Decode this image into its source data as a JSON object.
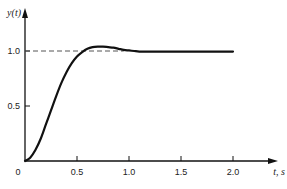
{
  "chart_data": {
    "type": "line",
    "title": "",
    "xlabel": "t, s",
    "ylabel": "y(t)",
    "xlim": [
      0,
      2.1
    ],
    "ylim": [
      0,
      1.2
    ],
    "x_ticks": [
      "0",
      "0.5",
      "1.0",
      "1.5",
      "2.0"
    ],
    "y_ticks": [
      "0.5",
      "1.0"
    ],
    "grid": false,
    "legend": null,
    "annotations": [
      {
        "type": "dashed-reference-line",
        "y": 1.0,
        "label": "1.0"
      }
    ],
    "series": [
      {
        "name": "step response y(t)",
        "x": [
          0,
          0.05,
          0.1,
          0.15,
          0.2,
          0.25,
          0.3,
          0.35,
          0.4,
          0.45,
          0.5,
          0.55,
          0.6,
          0.65,
          0.7,
          0.75,
          0.8,
          0.85,
          0.9,
          0.95,
          1.0,
          1.05,
          1.1,
          1.2,
          1.3,
          1.4,
          1.5,
          1.6,
          1.7,
          1.8,
          1.9,
          2.0
        ],
        "values": [
          0,
          0.03,
          0.1,
          0.2,
          0.33,
          0.46,
          0.59,
          0.71,
          0.81,
          0.89,
          0.95,
          0.99,
          1.02,
          1.035,
          1.04,
          1.04,
          1.035,
          1.03,
          1.02,
          1.01,
          1.005,
          1.0,
          0.995,
          0.995,
          0.995,
          0.995,
          0.995,
          0.995,
          0.995,
          0.995,
          0.995,
          0.995
        ]
      }
    ]
  },
  "labels": {
    "y_axis": "y(t)",
    "x_axis": "t, s",
    "origin": "0"
  }
}
